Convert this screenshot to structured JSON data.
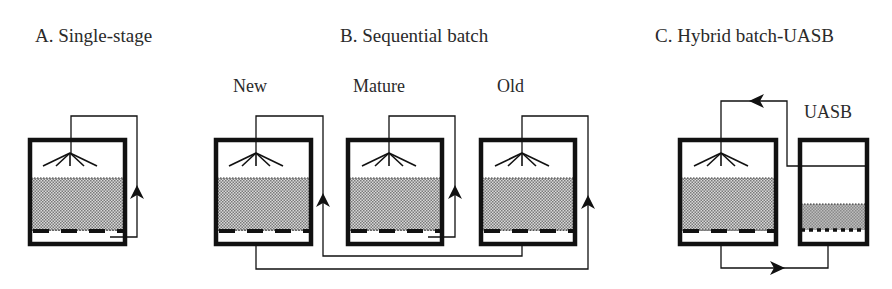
{
  "figure": {
    "panels": [
      {
        "id": "A",
        "title": "A. Single-stage",
        "reactors": [
          {
            "label": "",
            "type": "batch",
            "recirculation": "internal"
          }
        ]
      },
      {
        "id": "B",
        "title": "B. Sequential batch",
        "reactors": [
          {
            "label": "New",
            "type": "batch"
          },
          {
            "label": "Mature",
            "type": "batch",
            "recirculation": "internal"
          },
          {
            "label": "Old",
            "type": "batch"
          }
        ],
        "flow": "New leachate -> Old; Old leachate -> New"
      },
      {
        "id": "C",
        "title": "C. Hybrid batch-UASB",
        "reactors": [
          {
            "label": "",
            "type": "batch"
          },
          {
            "label": "UASB",
            "type": "uasb"
          }
        ],
        "flow": "Batch leachate -> UASB; UASB effluent -> Batch sprinkler"
      }
    ],
    "colors": {
      "line": "#111111",
      "bed_fill": "#9a9a9a",
      "text": "#2a2a2a",
      "background": "#ffffff"
    },
    "icons": [
      "sprinkler-icon",
      "flow-arrow-icon",
      "perforated-plate-icon"
    ]
  }
}
